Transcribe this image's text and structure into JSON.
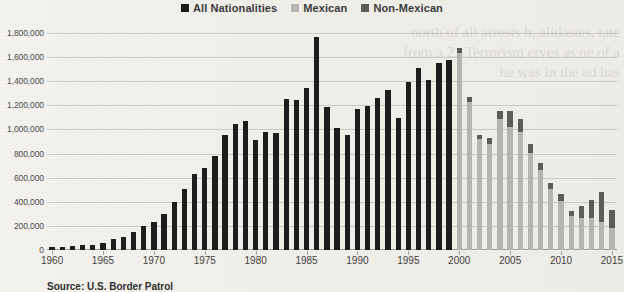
{
  "legend": {
    "position": "top-center",
    "items": [
      {
        "label": "All Nationalities",
        "color": "#1d1d1d",
        "key": "all"
      },
      {
        "label": "Mexican",
        "color": "#b6b4b0",
        "key": "mexican"
      },
      {
        "label": "Non-Mexican",
        "color": "#5d5c59",
        "key": "non_mexican"
      }
    ]
  },
  "caption": "Source: U.S. Border Patrol",
  "ghost_text": "north of all arrests\nb, alidastes, tate\nfrom a 21\nTerrorism\nerves as\nne of a\nhe was\nin the\nad has",
  "chart_data": {
    "type": "bar",
    "title": "",
    "subtitle": "",
    "xlabel": "",
    "ylabel": "",
    "stacked": true,
    "grid": true,
    "ylim": [
      0,
      1800000
    ],
    "ytick_step": 200000,
    "ytick_labels": [
      "0",
      "200,000",
      "400,000",
      "600,000",
      "800,000",
      "1,000,000",
      "1,200,000",
      "1,400,000",
      "1,600,000",
      "1,800,000"
    ],
    "ytick_values": [
      0,
      200000,
      400000,
      600000,
      800000,
      1000000,
      1200000,
      1400000,
      1600000,
      1800000
    ],
    "xlim": [
      1960,
      2015
    ],
    "xtick_labels": [
      "1960",
      "1965",
      "1970",
      "1975",
      "1980",
      "1985",
      "1990",
      "1995",
      "2000",
      "2005",
      "2010",
      "2015"
    ],
    "xtick_values": [
      1960,
      1965,
      1970,
      1975,
      1980,
      1985,
      1990,
      1995,
      2000,
      2005,
      2010,
      2015
    ],
    "categories": [
      1960,
      1961,
      1962,
      1963,
      1964,
      1965,
      1966,
      1967,
      1968,
      1969,
      1970,
      1971,
      1972,
      1973,
      1974,
      1975,
      1976,
      1977,
      1978,
      1979,
      1980,
      1981,
      1982,
      1983,
      1984,
      1985,
      1986,
      1987,
      1988,
      1989,
      1990,
      1991,
      1992,
      1993,
      1994,
      1995,
      1996,
      1997,
      1998,
      1999,
      2000,
      2001,
      2002,
      2003,
      2004,
      2005,
      2006,
      2007,
      2008,
      2009,
      2010,
      2011,
      2012,
      2013,
      2014,
      2015
    ],
    "series": [
      {
        "name": "All Nationalities",
        "color": "#1d1d1d",
        "values": [
          29000,
          29000,
          30000,
          39000,
          43000,
          55000,
          89000,
          108000,
          151000,
          201000,
          231000,
          302000,
          396000,
          506000,
          634000,
          680000,
          781000,
          954000,
          1047000,
          1069000,
          910000,
          976000,
          970000,
          1251000,
          1246000,
          1348000,
          1767000,
          1190000,
          1008000,
          954000,
          1169000,
          1197000,
          1258000,
          1327000,
          1094000,
          1394000,
          1507000,
          1412000,
          1555000,
          1579000,
          null,
          null,
          null,
          null,
          null,
          null,
          null,
          null,
          null,
          null,
          null,
          null,
          null,
          null,
          null,
          null
        ]
      },
      {
        "name": "Mexican",
        "color": "#b6b4b0",
        "values": [
          null,
          null,
          null,
          null,
          null,
          null,
          null,
          null,
          null,
          null,
          null,
          null,
          null,
          null,
          null,
          null,
          null,
          null,
          null,
          null,
          null,
          null,
          null,
          null,
          null,
          null,
          null,
          null,
          null,
          null,
          null,
          null,
          null,
          null,
          null,
          null,
          null,
          null,
          null,
          null,
          1636883,
          1224047,
          917993,
          882012,
          1085006,
          1023905,
          981066,
          808688,
          661766,
          503386,
          404365,
          286154,
          262341,
          265409,
          229178,
          186017
        ]
      },
      {
        "name": "Non-Mexican",
        "color": "#5d5c59",
        "values": [
          null,
          null,
          null,
          null,
          null,
          null,
          null,
          null,
          null,
          null,
          null,
          null,
          null,
          null,
          null,
          null,
          null,
          null,
          null,
          null,
          null,
          null,
          null,
          null,
          null,
          null,
          null,
          null,
          null,
          null,
          null,
          null,
          null,
          null,
          null,
          null,
          null,
          null,
          null,
          null,
          39010,
          42153,
          37405,
          43698,
          65814,
          126138,
          108025,
          67091,
          61106,
          52646,
          59017,
          40748,
          102117,
          148988,
          252600,
          145316
        ]
      }
    ]
  }
}
